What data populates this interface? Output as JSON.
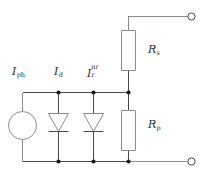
{
  "figure": {
    "name": "solar-cell-equivalent-circuit",
    "background_color": "#ffffff",
    "wire_color": "#4a4a4a",
    "component_color": "#8c8c8c",
    "label_color": "#2b2b2b"
  },
  "labels": {
    "photocurrent": {
      "symbol": "I",
      "subscript": "ph",
      "superscript": ""
    },
    "diode_current": {
      "symbol": "I",
      "subscript": "d",
      "superscript": ""
    },
    "recombination_current": {
      "symbol": "I",
      "subscript": "r",
      "superscript": "nr"
    },
    "series_resistance": {
      "symbol": "R",
      "subscript": "s",
      "superscript": ""
    },
    "shunt_resistance": {
      "symbol": "R",
      "subscript": "p",
      "superscript": ""
    }
  },
  "components": [
    {
      "name": "current-source",
      "type": "current-source",
      "label": "I_ph"
    },
    {
      "name": "diode-ideal",
      "type": "diode",
      "label": "I_d"
    },
    {
      "name": "diode-recombination",
      "type": "diode",
      "label": "I_r^nr"
    },
    {
      "name": "resistor-series",
      "type": "resistor",
      "label": "R_s"
    },
    {
      "name": "resistor-shunt",
      "type": "resistor",
      "label": "R_p"
    }
  ],
  "terminals": [
    {
      "name": "terminal-positive",
      "position": "top-right"
    },
    {
      "name": "terminal-negative",
      "position": "bottom-right"
    }
  ]
}
